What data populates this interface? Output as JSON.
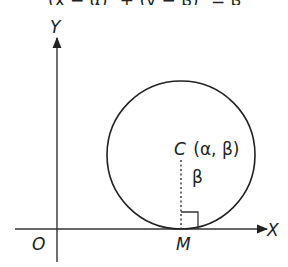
{
  "header": {
    "cropped_text": "(x − α)² + (y − β)² = β²"
  },
  "diagram": {
    "type": "circle touching x-axis",
    "axes": {
      "x_label": "X",
      "y_label": "Y",
      "origin_label": "O"
    },
    "circle": {
      "center_label": "C (α, β)",
      "radius_label": "β",
      "touch_point_label": "M"
    },
    "colors": {
      "stroke": "#222222",
      "background": "#ffffff"
    }
  }
}
